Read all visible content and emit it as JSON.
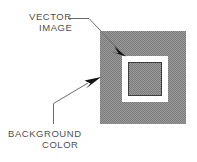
{
  "figure": {
    "background_color": "#ffffff",
    "annotations": [
      {
        "id": "vector-image",
        "lines": [
          "VECTOR",
          "IMAGE"
        ],
        "text": "VECTOR IMAGE",
        "target": "inner square (vector image)",
        "leader": {
          "type": "elbow-arrow",
          "horizontal_from": [
            68,
            18
          ],
          "horizontal_to": [
            89,
            18
          ],
          "arrow_tip": [
            126,
            56
          ]
        }
      },
      {
        "id": "background-color",
        "lines": [
          "BACKGROUND",
          "COLOR"
        ],
        "text": "BACKGROUND COLOR",
        "target": "outer gray square (background color)",
        "leader": {
          "type": "elbow-arrow",
          "vertical_from": [
            53,
            124
          ],
          "vertical_to": [
            53,
            103
          ],
          "arrow_tip": [
            101,
            78
          ]
        }
      }
    ],
    "shapes": {
      "outer_square": {
        "name": "background-color-square",
        "x": 100,
        "y": 31,
        "width": 86,
        "height": 93,
        "fill": "#8c8c8c",
        "fill_style": "dithered gray halftone"
      },
      "white_band_square": {
        "name": "vector-image-outline",
        "x": 122,
        "y": 56,
        "width": 46,
        "height": 46,
        "fill": "#ffffff",
        "band_width": 6
      },
      "inner_square": {
        "name": "vector-image-fill",
        "x": 128,
        "y": 62,
        "width": 34,
        "height": 34,
        "fill": "#8c8c8c",
        "stroke": "#3a3a3a",
        "stroke_width": 1
      }
    },
    "colors": {
      "gray_fill": "#8c8c8c",
      "white": "#ffffff",
      "line": "#5a5a5a",
      "arrow": "#1a1a1a",
      "text": "#4f4f4f"
    }
  }
}
